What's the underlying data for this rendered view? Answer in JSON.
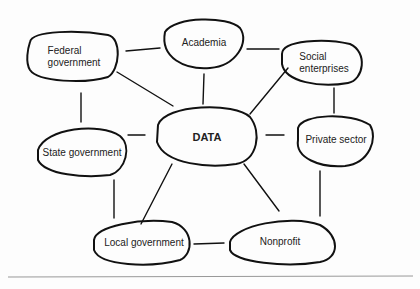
{
  "diagram": {
    "center": {
      "id": "data",
      "label": "DATA"
    },
    "nodes": [
      {
        "id": "federal",
        "label": "Federal\ngovernment"
      },
      {
        "id": "academia",
        "label": "Academia"
      },
      {
        "id": "social",
        "label": "Social\nenterprises"
      },
      {
        "id": "state",
        "label": "State government"
      },
      {
        "id": "private",
        "label": "Private sector"
      },
      {
        "id": "local",
        "label": "Local government"
      },
      {
        "id": "nonprofit",
        "label": "Nonprofit"
      }
    ],
    "edges": [
      [
        "federal",
        "academia"
      ],
      [
        "academia",
        "social"
      ],
      [
        "federal",
        "state"
      ],
      [
        "social",
        "private"
      ],
      [
        "state",
        "local"
      ],
      [
        "private",
        "nonprofit"
      ],
      [
        "local",
        "nonprofit"
      ],
      [
        "data",
        "federal"
      ],
      [
        "data",
        "academia"
      ],
      [
        "data",
        "social"
      ],
      [
        "data",
        "state"
      ],
      [
        "data",
        "private"
      ],
      [
        "data",
        "local"
      ],
      [
        "data",
        "nonprofit"
      ]
    ],
    "stroke_color": "#111111",
    "text_color": "#222222"
  }
}
